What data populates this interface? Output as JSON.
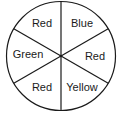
{
  "diagram": {
    "type": "spinner",
    "sections": [
      {
        "label": "Blue"
      },
      {
        "label": "Red"
      },
      {
        "label": "Yellow"
      },
      {
        "label": "Red"
      },
      {
        "label": "Green"
      },
      {
        "label": "Red"
      }
    ],
    "colors": {
      "stroke": "#1a1a1a",
      "background": "#ffffff"
    }
  }
}
